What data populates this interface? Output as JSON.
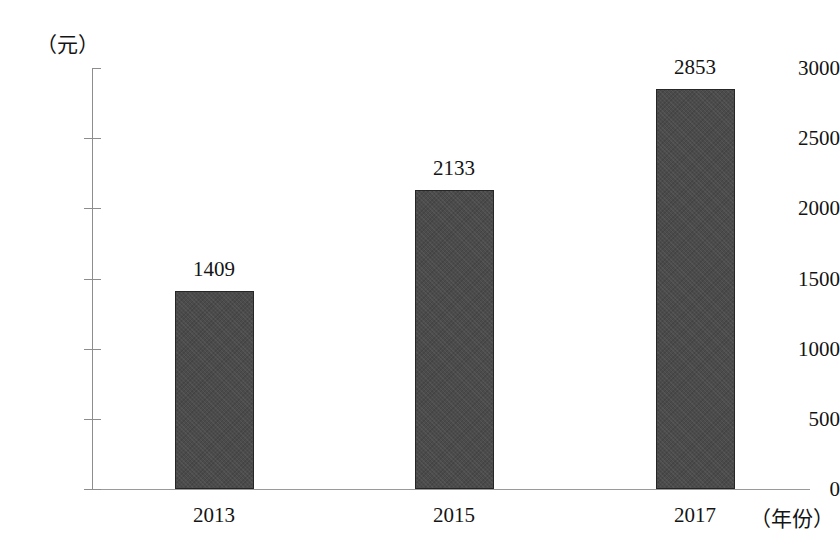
{
  "chart_data": {
    "type": "bar",
    "title": "",
    "xlabel": "（年份）",
    "ylabel": "（元）",
    "categories": [
      "2013",
      "2015",
      "2017"
    ],
    "values": [
      1409,
      2133,
      2853
    ],
    "value_labels": [
      "1409",
      "2133",
      "2853"
    ],
    "ylim": [
      0,
      3000
    ],
    "ytick_labels": [
      "0",
      "500",
      "1000",
      "1500",
      "2000",
      "2500",
      "3000"
    ],
    "ytick_values": [
      0,
      500,
      1000,
      1500,
      2000,
      2500,
      3000
    ],
    "grid": false,
    "legend": "none",
    "series": [
      {
        "name": "",
        "values": [
          1409,
          2133,
          2853
        ]
      }
    ],
    "bar_color": "#4b4b4b",
    "bar_border_color": "#262626",
    "axis_color": "#8d8d8d",
    "text_color": "#141414",
    "background_color": "#ffffff"
  }
}
